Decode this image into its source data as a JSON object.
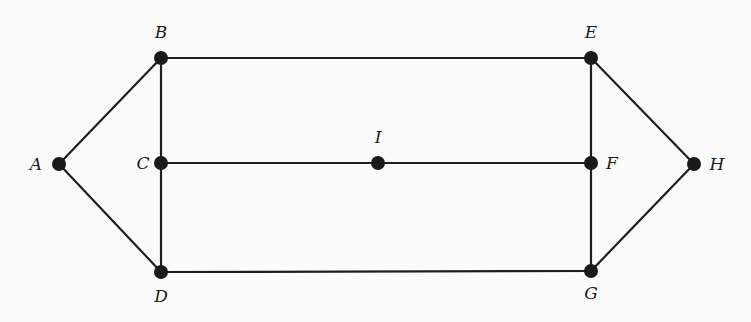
{
  "diagram": {
    "type": "graph",
    "nodes": [
      {
        "id": "A",
        "label": "A",
        "x": 59,
        "y": 164,
        "lx": 36,
        "ly": 170,
        "anchor": "middle"
      },
      {
        "id": "B",
        "label": "B",
        "x": 161,
        "y": 58,
        "lx": 161,
        "ly": 38,
        "anchor": "middle"
      },
      {
        "id": "C",
        "label": "C",
        "x": 161,
        "y": 163,
        "lx": 143,
        "ly": 169,
        "anchor": "middle"
      },
      {
        "id": "D",
        "label": "D",
        "x": 161,
        "y": 272,
        "lx": 161,
        "ly": 302,
        "anchor": "middle"
      },
      {
        "id": "E",
        "label": "E",
        "x": 591,
        "y": 58,
        "lx": 591,
        "ly": 38,
        "anchor": "middle"
      },
      {
        "id": "F",
        "label": "F",
        "x": 591,
        "y": 163,
        "lx": 612,
        "ly": 169,
        "anchor": "middle"
      },
      {
        "id": "G",
        "label": "G",
        "x": 591,
        "y": 271,
        "lx": 591,
        "ly": 299,
        "anchor": "middle"
      },
      {
        "id": "H",
        "label": "H",
        "x": 694,
        "y": 164,
        "lx": 717,
        "ly": 170,
        "anchor": "middle"
      },
      {
        "id": "I",
        "label": "I",
        "x": 378,
        "y": 163,
        "lx": 378,
        "ly": 143,
        "anchor": "middle"
      }
    ],
    "edges": [
      [
        "A",
        "B"
      ],
      [
        "A",
        "D"
      ],
      [
        "B",
        "C"
      ],
      [
        "C",
        "D"
      ],
      [
        "B",
        "E"
      ],
      [
        "D",
        "G"
      ],
      [
        "C",
        "I"
      ],
      [
        "I",
        "F"
      ],
      [
        "E",
        "F"
      ],
      [
        "F",
        "G"
      ],
      [
        "E",
        "H"
      ],
      [
        "G",
        "H"
      ]
    ]
  }
}
